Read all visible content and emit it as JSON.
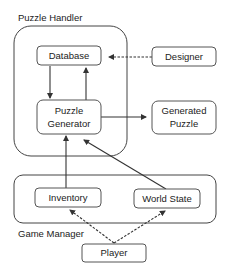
{
  "diagram": {
    "containers": {
      "puzzle_handler": {
        "label": "Puzzle Handler"
      },
      "game_manager": {
        "label": "Game Manager"
      }
    },
    "nodes": {
      "database": {
        "label": "Database"
      },
      "designer": {
        "label": "Designer"
      },
      "puzzle_generator": {
        "line1": "Puzzle",
        "line2": "Generator"
      },
      "generated_puzzle": {
        "line1": "Generated",
        "line2": "Puzzle"
      },
      "inventory": {
        "label": "Inventory"
      },
      "world_state": {
        "label": "World State"
      },
      "player": {
        "label": "Player"
      }
    },
    "edges": [
      {
        "from": "Designer",
        "to": "Database",
        "style": "dashed"
      },
      {
        "from": "Database",
        "to": "Puzzle Generator",
        "style": "solid"
      },
      {
        "from": "Puzzle Generator",
        "to": "Database",
        "style": "solid"
      },
      {
        "from": "Puzzle Generator",
        "to": "Generated Puzzle",
        "style": "solid"
      },
      {
        "from": "Inventory",
        "to": "Puzzle Generator",
        "style": "solid"
      },
      {
        "from": "World State",
        "to": "Puzzle Generator",
        "style": "solid"
      },
      {
        "from": "Player",
        "to": "Inventory",
        "style": "dashed"
      },
      {
        "from": "Player",
        "to": "World State",
        "style": "dashed"
      }
    ]
  }
}
